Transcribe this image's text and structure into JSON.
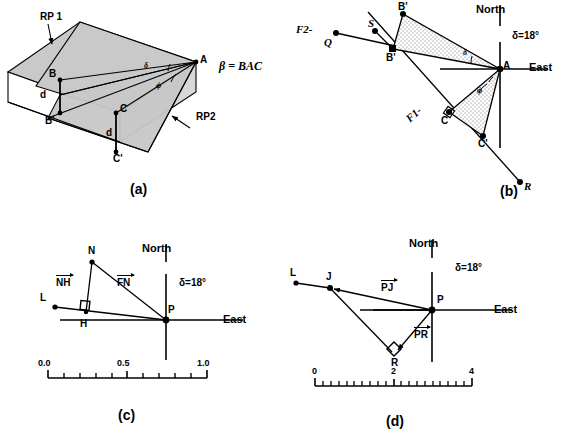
{
  "figure": {
    "panels": [
      {
        "id": "a",
        "caption": "(a)"
      },
      {
        "id": "b",
        "caption": "(b)"
      },
      {
        "id": "c",
        "caption": "(c)"
      },
      {
        "id": "d",
        "caption": "(d)"
      }
    ]
  },
  "panel_a": {
    "caption": "(a)",
    "labels": {
      "rp1": "RP 1",
      "rp2": "RP2",
      "A": "A",
      "B": "B",
      "Bp": "B'",
      "C": "C",
      "Cp": "C'",
      "d_left": "d",
      "d_right": "d",
      "angle_delta": "δ",
      "angle_phi": "ϕ",
      "beta_def": "β = BAC"
    }
  },
  "panel_b": {
    "caption": "(b)",
    "labels": {
      "north": "North",
      "east": "East",
      "delta_value": "δ=18°",
      "A": "A",
      "B": "B",
      "Bp": "B'",
      "C": "C",
      "Cp": "C'",
      "Q": "Q",
      "S": "S",
      "R": "R",
      "f2": "F2-",
      "f1": "F1-",
      "angle_delta": "δ",
      "angle_phi": "ϕ"
    }
  },
  "panel_c": {
    "caption": "(c)",
    "labels": {
      "north": "North",
      "east": "East",
      "delta_value": "δ=18°",
      "N": "N",
      "H": "H",
      "L": "L",
      "P": "P",
      "vector_nh": "NH",
      "vector_fn": "FN"
    },
    "scale": {
      "ticks": [
        "0.0",
        "0.5",
        "1.0"
      ],
      "min": 0.0,
      "max": 1.0,
      "minor_divisions": 10
    }
  },
  "panel_d": {
    "caption": "(d)",
    "labels": {
      "north": "North",
      "east": "East",
      "delta_value": "δ=18°",
      "L": "L",
      "J": "J",
      "P": "P",
      "R": "R",
      "vector_pj": "PJ",
      "vector_pr": "PR"
    },
    "scale": {
      "ticks": [
        "0",
        "2",
        "4"
      ],
      "min": 0,
      "max": 4,
      "minor_divisions": 20
    }
  },
  "colors": {
    "line": "#000000",
    "shade_gray": "#c9c9c9",
    "shade_light": "#e2e2e2",
    "stipple": "#8a8a8a",
    "background": "#ffffff"
  }
}
